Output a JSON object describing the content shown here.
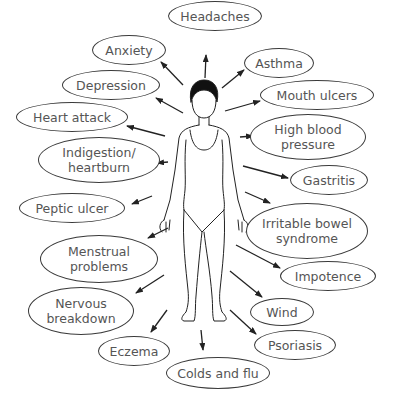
{
  "colors": {
    "outline": "#3a3a3a",
    "text": "#555555",
    "arrow": "#222222",
    "background": "#ffffff"
  },
  "figure": {
    "icon": "human-figure-icon"
  },
  "conditions": [
    {
      "id": "anxiety",
      "label": "Anxiety",
      "x": 92,
      "y": 35,
      "w": 74,
      "h": 30,
      "ax1": 183,
      "ay1": 85,
      "ax2": 161,
      "ay2": 62
    },
    {
      "id": "headaches",
      "label": "Headaches",
      "x": 168,
      "y": 1,
      "w": 94,
      "h": 30,
      "ax1": 205,
      "ay1": 78,
      "ax2": 206,
      "ay2": 55
    },
    {
      "id": "asthma",
      "label": "Asthma",
      "x": 244,
      "y": 48,
      "w": 70,
      "h": 30,
      "ax1": 222,
      "ay1": 88,
      "ax2": 244,
      "ay2": 70
    },
    {
      "id": "depression",
      "label": "Depression",
      "x": 62,
      "y": 70,
      "w": 98,
      "h": 30,
      "ax1": 183,
      "ay1": 113,
      "ax2": 156,
      "ay2": 98
    },
    {
      "id": "mouth-ulcers",
      "label": "Mouth ulcers",
      "x": 260,
      "y": 80,
      "w": 114,
      "h": 30,
      "ax1": 225,
      "ay1": 111,
      "ax2": 260,
      "ay2": 101
    },
    {
      "id": "heart-attack",
      "label": "Heart attack",
      "x": 16,
      "y": 102,
      "w": 112,
      "h": 30,
      "ax1": 165,
      "ay1": 136,
      "ax2": 127,
      "ay2": 126
    },
    {
      "id": "high-blood-pressure",
      "label": "High blood\npressure",
      "x": 250,
      "y": 114,
      "w": 116,
      "h": 46,
      "ax1": 240,
      "ay1": 137,
      "ax2": 253,
      "ay2": 136
    },
    {
      "id": "indigestion-heartburn",
      "label": "Indigestion/\nheartburn",
      "x": 38,
      "y": 137,
      "w": 122,
      "h": 46,
      "ax1": 168,
      "ay1": 162,
      "ax2": 157,
      "ay2": 163
    },
    {
      "id": "gastritis",
      "label": "Gastritis",
      "x": 290,
      "y": 165,
      "w": 78,
      "h": 30,
      "ax1": 243,
      "ay1": 166,
      "ax2": 288,
      "ay2": 178
    },
    {
      "id": "peptic-ulcer",
      "label": "Peptic ulcer",
      "x": 19,
      "y": 193,
      "w": 106,
      "h": 30,
      "ax1": 152,
      "ay1": 196,
      "ax2": 132,
      "ay2": 204
    },
    {
      "id": "irritable-bowel-syndrome",
      "label": "Irritable bowel\nsyndrome",
      "x": 246,
      "y": 203,
      "w": 122,
      "h": 56,
      "ax1": 245,
      "ay1": 192,
      "ax2": 270,
      "ay2": 203
    },
    {
      "id": "menstrual-problems",
      "label": "Menstrual\nproblems",
      "x": 40,
      "y": 235,
      "w": 118,
      "h": 48,
      "ax1": 168,
      "ay1": 228,
      "ax2": 148,
      "ay2": 238
    },
    {
      "id": "impotence",
      "label": "Impotence",
      "x": 280,
      "y": 261,
      "w": 96,
      "h": 30,
      "ax1": 236,
      "ay1": 245,
      "ax2": 280,
      "ay2": 268
    },
    {
      "id": "nervous-breakdown",
      "label": "Nervous\nbreakdown",
      "x": 28,
      "y": 287,
      "w": 106,
      "h": 48,
      "ax1": 164,
      "ay1": 275,
      "ax2": 136,
      "ay2": 293
    },
    {
      "id": "wind",
      "label": "Wind",
      "x": 250,
      "y": 298,
      "w": 64,
      "h": 28,
      "ax1": 230,
      "ay1": 271,
      "ax2": 262,
      "ay2": 297
    },
    {
      "id": "eczema",
      "label": "Eczema",
      "x": 98,
      "y": 336,
      "w": 72,
      "h": 30,
      "ax1": 167,
      "ay1": 310,
      "ax2": 151,
      "ay2": 332
    },
    {
      "id": "psoriasis",
      "label": "Psoriasis",
      "x": 254,
      "y": 330,
      "w": 82,
      "h": 30,
      "ax1": 230,
      "ay1": 310,
      "ax2": 256,
      "ay2": 334
    },
    {
      "id": "colds-and-flu",
      "label": "Colds and flu",
      "x": 166,
      "y": 357,
      "w": 104,
      "h": 32,
      "ax1": 201,
      "ay1": 330,
      "ax2": 203,
      "ay2": 350
    }
  ]
}
